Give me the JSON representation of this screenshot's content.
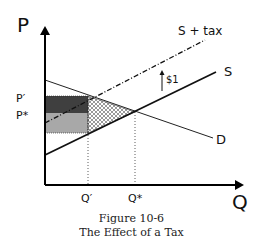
{
  "axes": {
    "y_label": "P",
    "x_label": "Q"
  },
  "price_labels": {
    "p_prime": "P′",
    "p_star": "P*"
  },
  "quantity_labels": {
    "q_prime": "Q′",
    "q_star": "Q*"
  },
  "curves": {
    "supply": "S",
    "supply_tax": "S + tax",
    "demand": "D"
  },
  "tax_arrow_label": "$1",
  "caption": {
    "line1": "Figure 10-6",
    "line2": "The Effect of a Tax"
  },
  "colors": {
    "consumer_burden": "#3f3f3f",
    "producer_burden": "#a8a8a8",
    "deadweight_hatch": "#555555",
    "lines": "#111111"
  }
}
